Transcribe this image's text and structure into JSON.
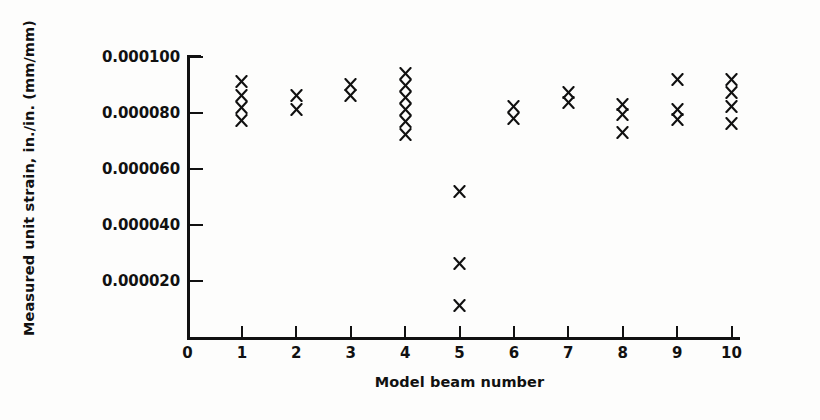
{
  "chart_data": {
    "type": "scatter",
    "title": "",
    "xlabel": "Model beam number",
    "ylabel": "Measured unit strain, in./in. (mm/mm)",
    "xlim": [
      0,
      10.15
    ],
    "ylim": [
      0,
      0.000105
    ],
    "grid": false,
    "legend": null,
    "marker": "x",
    "marker_color": "#111111",
    "xticks": [
      0,
      1,
      2,
      3,
      4,
      5,
      6,
      7,
      8,
      9,
      10
    ],
    "xtick_labels": [
      "0",
      "1",
      "2",
      "3",
      "4",
      "5",
      "6",
      "7",
      "8",
      "9",
      "10"
    ],
    "yticks": [
      2e-05,
      4e-05,
      6e-05,
      8e-05,
      0.0001
    ],
    "ytick_labels": [
      "0.000020",
      "0.000040",
      "0.000060",
      "0.000080",
      "0.000100"
    ],
    "series": [
      {
        "name": "Measured unit strain",
        "points": [
          {
            "x": 1,
            "y": 9.12e-05
          },
          {
            "x": 1,
            "y": 8.62e-05
          },
          {
            "x": 1,
            "y": 8.18e-05
          },
          {
            "x": 1,
            "y": 7.72e-05
          },
          {
            "x": 2,
            "y": 8.62e-05
          },
          {
            "x": 2,
            "y": 8.12e-05
          },
          {
            "x": 3,
            "y": 9.02e-05
          },
          {
            "x": 3,
            "y": 8.62e-05
          },
          {
            "x": 4,
            "y": 9.4e-05
          },
          {
            "x": 4,
            "y": 8.98e-05
          },
          {
            "x": 4,
            "y": 8.55e-05
          },
          {
            "x": 4,
            "y": 8.12e-05
          },
          {
            "x": 4,
            "y": 7.68e-05
          },
          {
            "x": 4,
            "y": 7.22e-05
          },
          {
            "x": 5,
            "y": 5.2e-05
          },
          {
            "x": 5,
            "y": 2.62e-05
          },
          {
            "x": 5,
            "y": 1.12e-05
          },
          {
            "x": 6,
            "y": 8.22e-05
          },
          {
            "x": 6,
            "y": 7.82e-05
          },
          {
            "x": 7,
            "y": 8.72e-05
          },
          {
            "x": 7,
            "y": 8.38e-05
          },
          {
            "x": 8,
            "y": 8.32e-05
          },
          {
            "x": 8,
            "y": 7.95e-05
          },
          {
            "x": 8,
            "y": 7.3e-05
          },
          {
            "x": 9,
            "y": 9.2e-05
          },
          {
            "x": 9,
            "y": 8.12e-05
          },
          {
            "x": 9,
            "y": 7.78e-05
          },
          {
            "x": 10,
            "y": 9.18e-05
          },
          {
            "x": 10,
            "y": 8.72e-05
          },
          {
            "x": 10,
            "y": 8.22e-05
          },
          {
            "x": 10,
            "y": 7.62e-05
          }
        ]
      }
    ]
  }
}
